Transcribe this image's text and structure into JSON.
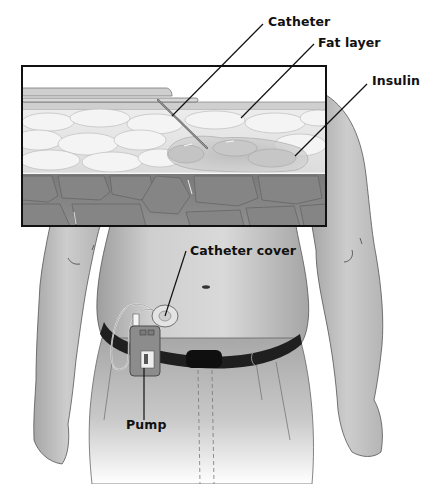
{
  "diagram": {
    "type": "medical-illustration",
    "labels": [
      {
        "id": "catheter",
        "text": "Catheter"
      },
      {
        "id": "fat-layer",
        "text": "Fat layer"
      },
      {
        "id": "insulin",
        "text": "Insulin"
      },
      {
        "id": "catheter-cover",
        "text": "Catheter cover"
      },
      {
        "id": "pump",
        "text": "Pump"
      }
    ],
    "colors": {
      "skin": "#d6d6d6",
      "skin_shadow": "#9a9a9a",
      "fat": "#e8e8e8",
      "muscle": "#7c7c7c",
      "belt": "#1e1e1e",
      "pump_body": "#8a8a8a",
      "inset_border": "#111111",
      "leader_line": "#111111"
    }
  }
}
